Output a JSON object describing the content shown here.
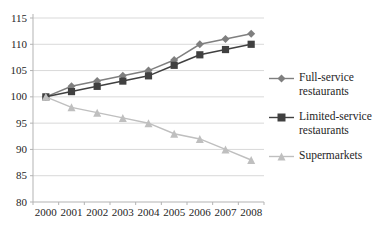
{
  "chart_data": {
    "type": "line",
    "title": "",
    "xlabel": "",
    "ylabel": "",
    "categories": [
      "2000",
      "2001",
      "2002",
      "2003",
      "2004",
      "2005",
      "2006",
      "2007",
      "2008"
    ],
    "series": [
      {
        "name": "Full-service restaurants",
        "marker": "diamond",
        "color": "#7f7f7f",
        "values": [
          100,
          102,
          103,
          104,
          105,
          107,
          110,
          111,
          112
        ]
      },
      {
        "name": "Limited-service restaurants",
        "marker": "square",
        "color": "#404040",
        "values": [
          100,
          101,
          102,
          103,
          104,
          106,
          108,
          109,
          110
        ]
      },
      {
        "name": "Supermarkets",
        "marker": "triangle",
        "color": "#bfbfbf",
        "values": [
          100,
          98,
          97,
          96,
          95,
          93,
          92,
          90,
          88
        ]
      }
    ],
    "ylim": [
      80,
      115
    ],
    "yticks": [
      80,
      85,
      90,
      95,
      100,
      105,
      110,
      115
    ],
    "grid": true,
    "legend_position": "right",
    "colors": {
      "gridline": "#d9d9d9",
      "axis": "#b3b3b3",
      "tick_label": "#262626"
    }
  }
}
